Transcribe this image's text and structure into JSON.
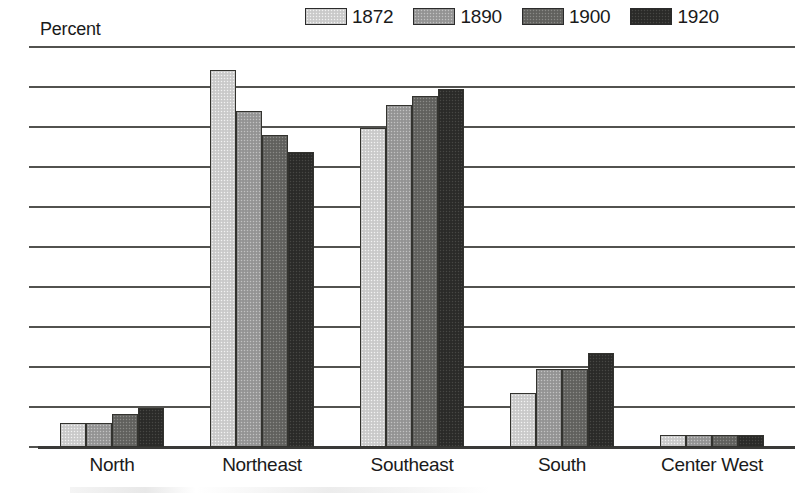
{
  "axis_title": "Percent",
  "legend": {
    "entries": [
      {
        "label": "1872",
        "color": "#cfcfcf"
      },
      {
        "label": "1890",
        "color": "#9a9a9a"
      },
      {
        "label": "1900",
        "color": "#666663"
      },
      {
        "label": "1920",
        "color": "#2e2e2c"
      }
    ]
  },
  "yaxis": {
    "ticks": [
      "50",
      "45",
      "40",
      "35",
      "30",
      "25",
      "20",
      "15",
      "10",
      "5",
      "0"
    ]
  },
  "categories": [
    "North",
    "Northeast",
    "Southeast",
    "South",
    "Center West"
  ],
  "chart_data": {
    "type": "bar",
    "title": "",
    "subtitle": "",
    "xlabel": "",
    "ylabel": "Percent",
    "ylim": [
      0,
      50
    ],
    "ytick_step": 5,
    "grid": true,
    "legend_position": "top-right",
    "categories": [
      "North",
      "Northeast",
      "Southeast",
      "South",
      "Center West"
    ],
    "series": [
      {
        "name": "1872",
        "color": "#cfcfcf",
        "values": [
          3.0,
          47.1,
          39.9,
          6.8,
          1.5
        ]
      },
      {
        "name": "1890",
        "color": "#9a9a9a",
        "values": [
          3.0,
          42.0,
          42.8,
          9.8,
          1.5
        ]
      },
      {
        "name": "1900",
        "color": "#666663",
        "values": [
          4.1,
          39.0,
          43.9,
          9.8,
          1.5
        ]
      },
      {
        "name": "1920",
        "color": "#2e2e2c",
        "values": [
          4.9,
          36.9,
          44.7,
          11.7,
          1.5
        ]
      }
    ]
  }
}
